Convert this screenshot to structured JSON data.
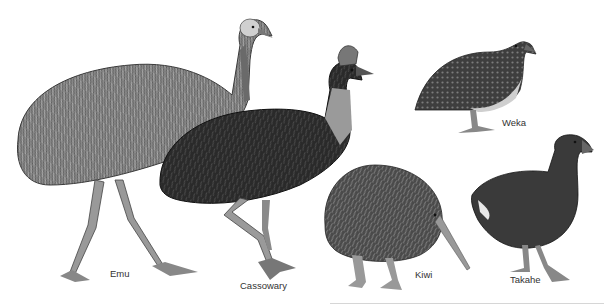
{
  "illustration": {
    "subject": "Flightless birds",
    "birds": [
      {
        "name": "Emu",
        "label": "Emu"
      },
      {
        "name": "Cassowary",
        "label": "Cassowary"
      },
      {
        "name": "Kiwi",
        "label": "Kiwi"
      },
      {
        "name": "Weka",
        "label": "Weka"
      },
      {
        "name": "Takahe",
        "label": "Takahe"
      }
    ]
  },
  "colors": {
    "background": "#ffffff",
    "label_text": "#333333"
  }
}
